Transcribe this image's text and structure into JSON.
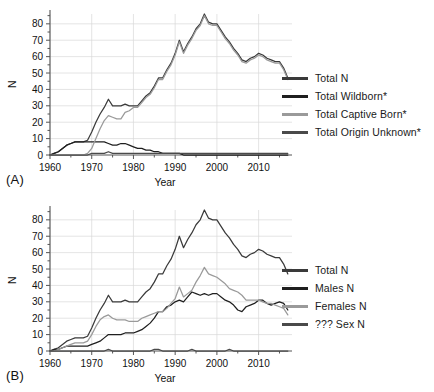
{
  "figure": {
    "panel_a_tag": "(A)",
    "panel_b_tag": "(B)"
  },
  "colors": {
    "total_n": "#3a3a3a",
    "wildborn": "#1f1f1f",
    "captive_born": "#9a9a9a",
    "origin_unknown": "#4a4a4a",
    "males": "#1f1f1f",
    "females": "#9a9a9a",
    "unknown_sex": "#4a4a4a",
    "grid": "#d8d8d8",
    "axis": "#555555",
    "text": "#111111"
  },
  "legend_a": {
    "items": [
      {
        "label": "Total N",
        "color": "#3a3a3a"
      },
      {
        "label": "Total Wildborn*",
        "color": "#1f1f1f"
      },
      {
        "label": "Total Captive Born*",
        "color": "#9a9a9a"
      },
      {
        "label": "Total Origin Unknown*",
        "color": "#4a4a4a"
      }
    ]
  },
  "legend_b": {
    "items": [
      {
        "label": "Total N",
        "color": "#3a3a3a"
      },
      {
        "label": "Males N",
        "color": "#1f1f1f"
      },
      {
        "label": "Females N",
        "color": "#9a9a9a"
      },
      {
        "label": "??? Sex N",
        "color": "#4a4a4a"
      }
    ]
  },
  "chart_data": [
    {
      "type": "line",
      "panel": "A",
      "title": "",
      "xlabel": "Year",
      "ylabel": "N",
      "xlim": [
        1960,
        2018
      ],
      "ylim": [
        0,
        86
      ],
      "xticks": [
        1960,
        1970,
        1980,
        1990,
        2000,
        2010
      ],
      "yticks": [
        0,
        10,
        20,
        30,
        40,
        50,
        60,
        70,
        80
      ],
      "grid": true,
      "legend_position": "right",
      "x": [
        1960,
        1961,
        1962,
        1963,
        1964,
        1965,
        1966,
        1967,
        1968,
        1969,
        1970,
        1971,
        1972,
        1973,
        1974,
        1975,
        1976,
        1977,
        1978,
        1979,
        1980,
        1981,
        1982,
        1983,
        1984,
        1985,
        1986,
        1987,
        1988,
        1989,
        1990,
        1991,
        1992,
        1993,
        1994,
        1995,
        1996,
        1997,
        1998,
        1999,
        2000,
        2001,
        2002,
        2003,
        2004,
        2005,
        2006,
        2007,
        2008,
        2009,
        2010,
        2011,
        2012,
        2013,
        2014,
        2015,
        2016,
        2017
      ],
      "series": [
        {
          "name": "Total N",
          "color": "#3a3a3a",
          "values": [
            0,
            1,
            2,
            4,
            6,
            7,
            8,
            8,
            8,
            9,
            14,
            20,
            25,
            29,
            34,
            30,
            30,
            30,
            31,
            30,
            30,
            30,
            33,
            36,
            38,
            42,
            47,
            47,
            52,
            56,
            62,
            70,
            63,
            68,
            72,
            77,
            80,
            86,
            81,
            80,
            80,
            76,
            72,
            69,
            65,
            62,
            58,
            57,
            59,
            60,
            62,
            61,
            59,
            58,
            57,
            57,
            53,
            47
          ]
        },
        {
          "name": "Total Wildborn*",
          "color": "#1f1f1f",
          "values": [
            0,
            1,
            2,
            4,
            6,
            7,
            8,
            8,
            8,
            8,
            8,
            8,
            8,
            8,
            7,
            6,
            6,
            7,
            7,
            6,
            5,
            4,
            4,
            3,
            3,
            2,
            2,
            1,
            1,
            1,
            1,
            1,
            0,
            0,
            0,
            0,
            0,
            0,
            0,
            0,
            0,
            0,
            0,
            0,
            0,
            0,
            0,
            0,
            0,
            0,
            0,
            0,
            0,
            0,
            0,
            0,
            0,
            0
          ]
        },
        {
          "name": "Total Captive Born*",
          "color": "#9a9a9a",
          "values": [
            0,
            0,
            0,
            0,
            0,
            0,
            0,
            0,
            0,
            1,
            4,
            10,
            16,
            21,
            24,
            23,
            22,
            22,
            26,
            27,
            29,
            29,
            32,
            35,
            37,
            41,
            46,
            46,
            51,
            55,
            61,
            69,
            62,
            67,
            71,
            76,
            79,
            85,
            80,
            79,
            79,
            75,
            71,
            68,
            64,
            61,
            57,
            56,
            58,
            59,
            61,
            60,
            58,
            57,
            56,
            56,
            52,
            46
          ]
        },
        {
          "name": "Total Origin Unknown*",
          "color": "#4a4a4a",
          "values": [
            0,
            0,
            0,
            0,
            0,
            0,
            0,
            0,
            0,
            0,
            1,
            1,
            1,
            1,
            2,
            1,
            1,
            1,
            1,
            1,
            1,
            1,
            1,
            1,
            1,
            1,
            1,
            1,
            1,
            1,
            1,
            1,
            1,
            1,
            1,
            1,
            1,
            1,
            1,
            1,
            1,
            1,
            1,
            1,
            1,
            1,
            1,
            1,
            1,
            1,
            1,
            1,
            1,
            1,
            1,
            1,
            1,
            1
          ]
        }
      ]
    },
    {
      "type": "line",
      "panel": "B",
      "title": "",
      "xlabel": "Year",
      "ylabel": "N",
      "xlim": [
        1960,
        2018
      ],
      "ylim": [
        0,
        86
      ],
      "xticks": [
        1960,
        1970,
        1980,
        1990,
        2000,
        2010
      ],
      "yticks": [
        0,
        10,
        20,
        30,
        40,
        50,
        60,
        70,
        80
      ],
      "grid": true,
      "legend_position": "right",
      "x": [
        1960,
        1961,
        1962,
        1963,
        1964,
        1965,
        1966,
        1967,
        1968,
        1969,
        1970,
        1971,
        1972,
        1973,
        1974,
        1975,
        1976,
        1977,
        1978,
        1979,
        1980,
        1981,
        1982,
        1983,
        1984,
        1985,
        1986,
        1987,
        1988,
        1989,
        1990,
        1991,
        1992,
        1993,
        1994,
        1995,
        1996,
        1997,
        1998,
        1999,
        2000,
        2001,
        2002,
        2003,
        2004,
        2005,
        2006,
        2007,
        2008,
        2009,
        2010,
        2011,
        2012,
        2013,
        2014,
        2015,
        2016,
        2017
      ],
      "series": [
        {
          "name": "Total N",
          "color": "#3a3a3a",
          "values": [
            0,
            1,
            2,
            4,
            6,
            7,
            8,
            8,
            8,
            9,
            14,
            20,
            25,
            29,
            34,
            30,
            30,
            30,
            31,
            30,
            30,
            30,
            33,
            36,
            38,
            42,
            47,
            47,
            52,
            56,
            62,
            70,
            63,
            68,
            72,
            77,
            80,
            86,
            81,
            80,
            80,
            76,
            72,
            69,
            65,
            62,
            58,
            57,
            59,
            60,
            62,
            61,
            59,
            58,
            57,
            57,
            53,
            47
          ]
        },
        {
          "name": "Males N",
          "color": "#1f1f1f",
          "values": [
            0,
            1,
            1,
            2,
            3,
            3,
            3,
            3,
            3,
            3,
            4,
            5,
            6,
            8,
            10,
            10,
            10,
            10,
            11,
            11,
            11,
            12,
            13,
            15,
            17,
            20,
            24,
            24,
            27,
            28,
            30,
            31,
            30,
            33,
            36,
            35,
            34,
            35,
            34,
            35,
            35,
            33,
            31,
            30,
            28,
            25,
            24,
            27,
            28,
            29,
            31,
            31,
            29,
            28,
            29,
            30,
            29,
            25
          ]
        },
        {
          "name": "Females N",
          "color": "#9a9a9a",
          "values": [
            0,
            0,
            1,
            2,
            3,
            4,
            5,
            5,
            5,
            6,
            10,
            15,
            19,
            21,
            22,
            20,
            19,
            19,
            19,
            18,
            18,
            18,
            20,
            21,
            22,
            23,
            24,
            24,
            26,
            29,
            32,
            39,
            33,
            35,
            37,
            42,
            46,
            51,
            47,
            46,
            45,
            43,
            41,
            38,
            37,
            36,
            34,
            31,
            31,
            31,
            31,
            30,
            29,
            29,
            28,
            27,
            26,
            22
          ]
        },
        {
          "name": "??? Sex N",
          "color": "#4a4a4a",
          "values": [
            0,
            0,
            0,
            0,
            0,
            0,
            0,
            0,
            0,
            0,
            0,
            0,
            0,
            0,
            1,
            0,
            0,
            0,
            0,
            0,
            0,
            0,
            0,
            0,
            0,
            1,
            1,
            0,
            0,
            0,
            0,
            0,
            0,
            0,
            1,
            0,
            0,
            0,
            0,
            0,
            0,
            0,
            0,
            1,
            0,
            0,
            0,
            0,
            0,
            0,
            0,
            0,
            0,
            0,
            0,
            0,
            0,
            0
          ]
        }
      ]
    }
  ]
}
